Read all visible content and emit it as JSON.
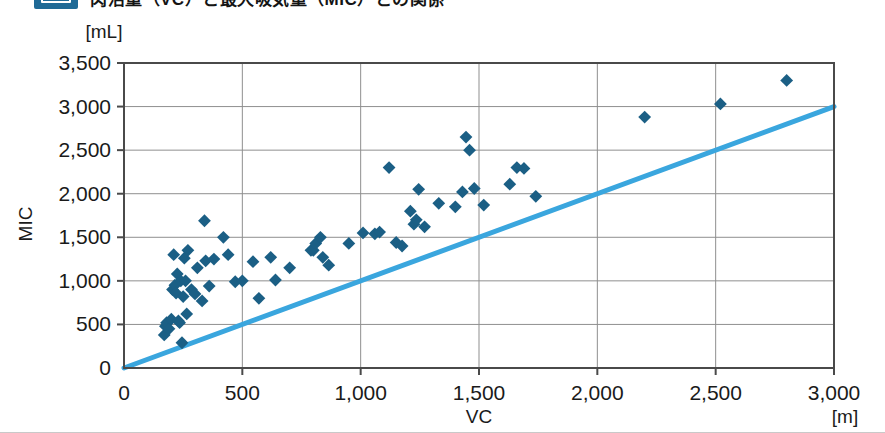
{
  "heading": {
    "badge_label": "",
    "title": "肉活量（VC）と最大吸気量（MIC）との関係"
  },
  "colors": {
    "marker": "#1b5f85",
    "identity_line": "#3aa6de",
    "axis": "#4a4a4a",
    "gridline": "#8f8f8f",
    "background": "#ffffff",
    "badge": "#1f6a96"
  },
  "chart_data": {
    "type": "scatter",
    "title": "",
    "xlabel": "VC",
    "ylabel": "MIC",
    "x_unit": "[m]",
    "y_unit": "[mL]",
    "xlim": [
      0,
      3000
    ],
    "ylim": [
      0,
      3500
    ],
    "xticks": [
      0,
      500,
      1000,
      1500,
      2000,
      2500,
      3000
    ],
    "xtick_labels": [
      "0",
      "500",
      "1,000",
      "1,500",
      "2,000",
      "2,500",
      "3,000"
    ],
    "yticks": [
      0,
      500,
      1000,
      1500,
      2000,
      2500,
      3000,
      3500
    ],
    "ytick_labels": [
      "0",
      "500",
      "1,000",
      "1,500",
      "2,000",
      "2,500",
      "3,000",
      "3,500"
    ],
    "grid": {
      "horizontal": true,
      "vertical": true
    },
    "legend": null,
    "series": [
      {
        "name": "VC vs MIC",
        "marker": "diamond",
        "color": "#1b5f85",
        "points": [
          [
            170,
            380
          ],
          [
            175,
            480
          ],
          [
            180,
            520
          ],
          [
            190,
            450
          ],
          [
            200,
            560
          ],
          [
            205,
            900
          ],
          [
            210,
            1300
          ],
          [
            215,
            950
          ],
          [
            220,
            860
          ],
          [
            225,
            1080
          ],
          [
            230,
            540
          ],
          [
            235,
            520
          ],
          [
            240,
            1000
          ],
          [
            245,
            290
          ],
          [
            250,
            820
          ],
          [
            255,
            1260
          ],
          [
            260,
            1000
          ],
          [
            265,
            620
          ],
          [
            270,
            1350
          ],
          [
            285,
            900
          ],
          [
            300,
            850
          ],
          [
            310,
            1150
          ],
          [
            330,
            770
          ],
          [
            340,
            1690
          ],
          [
            345,
            1230
          ],
          [
            360,
            940
          ],
          [
            380,
            1250
          ],
          [
            420,
            1500
          ],
          [
            440,
            1300
          ],
          [
            470,
            990
          ],
          [
            500,
            1000
          ],
          [
            545,
            1220
          ],
          [
            570,
            800
          ],
          [
            620,
            1270
          ],
          [
            640,
            1010
          ],
          [
            700,
            1150
          ],
          [
            790,
            1350
          ],
          [
            800,
            1350
          ],
          [
            810,
            1430
          ],
          [
            830,
            1500
          ],
          [
            840,
            1270
          ],
          [
            865,
            1180
          ],
          [
            950,
            1430
          ],
          [
            1010,
            1550
          ],
          [
            1060,
            1540
          ],
          [
            1080,
            1560
          ],
          [
            1120,
            2300
          ],
          [
            1150,
            1440
          ],
          [
            1175,
            1400
          ],
          [
            1210,
            1800
          ],
          [
            1225,
            1650
          ],
          [
            1235,
            1700
          ],
          [
            1245,
            2050
          ],
          [
            1270,
            1620
          ],
          [
            1330,
            1890
          ],
          [
            1400,
            1850
          ],
          [
            1430,
            2020
          ],
          [
            1445,
            2650
          ],
          [
            1460,
            2500
          ],
          [
            1480,
            2060
          ],
          [
            1520,
            1870
          ],
          [
            1630,
            2110
          ],
          [
            1660,
            2300
          ],
          [
            1690,
            2290
          ],
          [
            1740,
            1970
          ],
          [
            2200,
            2880
          ],
          [
            2520,
            3030
          ],
          [
            2800,
            3300
          ]
        ]
      }
    ],
    "reference_line": {
      "name": "identity-line",
      "type": "line",
      "color": "#3aa6de",
      "x": [
        0,
        3000
      ],
      "y": [
        0,
        3000
      ]
    }
  }
}
